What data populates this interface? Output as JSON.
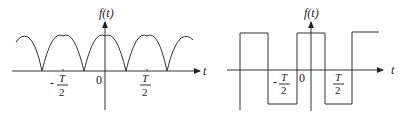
{
  "figures": [
    {
      "id": "left",
      "kind": "full-wave rectified sine (|cos|) waveform",
      "y_label": "f(t)",
      "x_label": "t",
      "origin_label": "0",
      "ticks": [
        {
          "label_num": "T",
          "label_den": "2",
          "sign": "-"
        },
        {
          "label_num": "T",
          "label_den": "2",
          "sign": ""
        }
      ]
    },
    {
      "id": "right",
      "kind": "square wave",
      "y_label": "f(t)",
      "x_label": "t",
      "origin_label": "0",
      "ticks": [
        {
          "label_num": "T",
          "label_den": "2",
          "sign": "-"
        },
        {
          "label_num": "T",
          "label_den": "2",
          "sign": ""
        }
      ]
    }
  ],
  "colors": {
    "line": "#333333",
    "text": "#222222",
    "background": "#ffffff"
  }
}
